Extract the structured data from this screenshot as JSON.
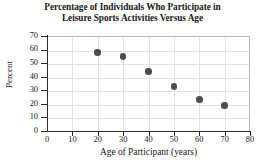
{
  "chart_data": {
    "type": "scatter",
    "title": "Percentage of Individuals Who Participate in Leisure Sports Activities Versus Age",
    "title_lines": [
      "Percentage of Individuals Who Participate in",
      "Leisure Sports Activities Versus Age"
    ],
    "xlabel": "Age of Participant (years)",
    "ylabel": "Percent",
    "x": [
      20,
      30,
      40,
      50,
      60,
      70
    ],
    "values": [
      58,
      55,
      44,
      33,
      23,
      19
    ],
    "points": [
      {
        "x": 20,
        "y": 58
      },
      {
        "x": 30,
        "y": 55
      },
      {
        "x": 40,
        "y": 44
      },
      {
        "x": 50,
        "y": 33
      },
      {
        "x": 60,
        "y": 23
      },
      {
        "x": 70,
        "y": 19
      }
    ],
    "xlim": [
      0,
      80
    ],
    "ylim": [
      0,
      70
    ],
    "xticks": [
      0,
      10,
      20,
      30,
      40,
      50,
      60,
      70,
      80
    ],
    "yticks": [
      0,
      10,
      20,
      30,
      40,
      50,
      60,
      70
    ],
    "xtick_labels": [
      "0",
      "10",
      "20",
      "30",
      "40",
      "50",
      "60",
      "70",
      "80"
    ],
    "ytick_labels": [
      "0",
      "10",
      "20",
      "30",
      "40",
      "50",
      "60",
      "70"
    ],
    "grid": true,
    "legend": null,
    "marker_color": "#4d4d4d",
    "axis_color": "#2b2b2b",
    "grid_color": "#e3e3e3",
    "background": "#ffffff"
  }
}
